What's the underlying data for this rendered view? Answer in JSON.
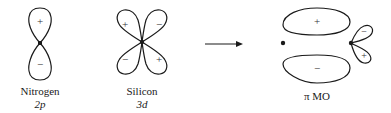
{
  "diagram": {
    "orbitals": [
      {
        "id": "nitrogen-2p",
        "name": "Nitrogen",
        "subtitle": "2p",
        "signs": [
          "+",
          "−"
        ]
      },
      {
        "id": "silicon-3d",
        "name": "Silicon",
        "subtitle": "3d",
        "signs": [
          "+",
          "−",
          "−",
          "+"
        ]
      },
      {
        "id": "pi-mo",
        "name": "π MO",
        "signs": [
          "+",
          "−",
          "−",
          "+"
        ]
      }
    ],
    "arrow": "reaction-arrow",
    "colors": {
      "stroke": "#1a1a1a",
      "background": "#ffffff"
    }
  }
}
